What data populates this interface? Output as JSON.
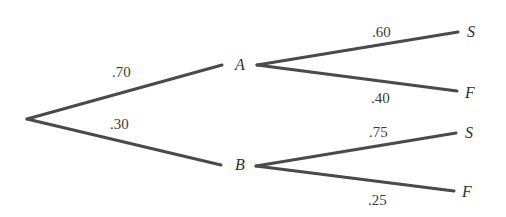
{
  "diagram": {
    "type": "probability-tree",
    "colors": {
      "line": "#4a4a4a",
      "text": "#3a3a3a",
      "background": "#ffffff"
    },
    "root": {
      "x": 27,
      "y": 119
    },
    "nodes": {
      "A": {
        "label": "A",
        "x": 240,
        "y": 70
      },
      "B": {
        "label": "B",
        "x": 240,
        "y": 170
      },
      "A_S": {
        "label": "S",
        "x": 471,
        "y": 37
      },
      "A_F": {
        "label": "F",
        "x": 470,
        "y": 98
      },
      "B_S": {
        "label": "S",
        "x": 469,
        "y": 138
      },
      "B_F": {
        "label": "F",
        "x": 467,
        "y": 197
      }
    },
    "edges": [
      {
        "from": "root",
        "to": "A",
        "prob": ".70",
        "x1": 27,
        "y1": 119,
        "x2": 222,
        "y2": 65,
        "lx": 112,
        "ly": 77
      },
      {
        "from": "root",
        "to": "B",
        "prob": ".30",
        "x1": 27,
        "y1": 119,
        "x2": 221,
        "y2": 165,
        "lx": 110,
        "ly": 129
      },
      {
        "from": "A",
        "to": "A_S",
        "prob": ".60",
        "x1": 257,
        "y1": 65,
        "x2": 458,
        "y2": 32,
        "lx": 372,
        "ly": 37
      },
      {
        "from": "A",
        "to": "A_F",
        "prob": ".40",
        "x1": 257,
        "y1": 65,
        "x2": 457,
        "y2": 91,
        "lx": 371,
        "ly": 103
      },
      {
        "from": "B",
        "to": "B_S",
        "prob": ".75",
        "x1": 256,
        "y1": 166,
        "x2": 456,
        "y2": 133,
        "lx": 369,
        "ly": 137
      },
      {
        "from": "B",
        "to": "B_F",
        "prob": ".25",
        "x1": 256,
        "y1": 166,
        "x2": 454,
        "y2": 191,
        "lx": 368,
        "ly": 205
      }
    ]
  }
}
